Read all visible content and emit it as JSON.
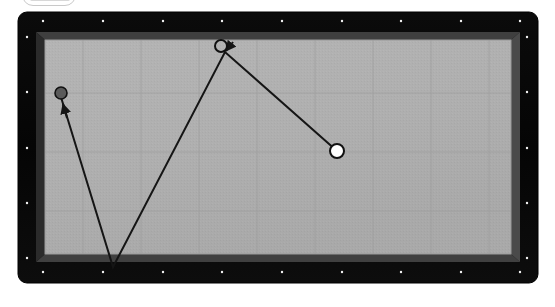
{
  "scene": {
    "title": "Air hockey table top-down view with puck trajectory",
    "background_color": "#ffffff"
  },
  "top_badge": {
    "label": "",
    "note": "partially cut off rounded badge at top-left edge",
    "border_color": "#c9c9c9",
    "fill_color": "#ffffff"
  },
  "table": {
    "name": "game-table",
    "frame_color": "#070707",
    "frame_highlight_color": "#3a3a3a",
    "frame_shadow_color": "#1c1c1c",
    "surface_color": "#b0b0b0",
    "surface_edge_color": "#9a9a9a",
    "grid_color": "#9c9c9c",
    "outer": {
      "x": 1,
      "y": 1,
      "width": 520,
      "height": 271,
      "radius": 9
    },
    "inner": {
      "x": 19,
      "y": 21,
      "width": 484,
      "height": 230
    },
    "rivet_color": "#f2f2f2",
    "rivets_top": [
      26,
      86,
      146,
      205,
      265,
      325,
      384,
      444,
      503
    ],
    "rivets_bottom": [
      26,
      86,
      146,
      205,
      265,
      325,
      384,
      444,
      503
    ],
    "rivets_left": [
      26,
      81,
      137,
      192,
      247
    ],
    "rivets_right": [
      26,
      81,
      137,
      192,
      247
    ],
    "grid_vertical_x": [
      66,
      124,
      182,
      240,
      298,
      356,
      414,
      472
    ],
    "grid_horizontal_y": [
      82,
      141,
      200
    ]
  },
  "markers": [
    {
      "id": "start-puck",
      "label": "start puck",
      "style": "filled-dark",
      "x": 44,
      "y": 82,
      "radius": 6,
      "fill": "#5a5a5a",
      "stroke": "#111111"
    },
    {
      "id": "apex-puck",
      "label": "apex puck",
      "style": "hollow",
      "x": 204,
      "y": 35,
      "radius": 6,
      "fill": "none",
      "stroke": "#111111"
    },
    {
      "id": "end-puck",
      "label": "end puck",
      "style": "filled-white",
      "x": 320,
      "y": 140,
      "radius": 7,
      "fill": "#ffffff",
      "stroke": "#111111"
    }
  ],
  "trajectory": {
    "name": "puck-path",
    "stroke": "#151515",
    "stroke_width": 2,
    "points": [
      {
        "x": 320,
        "y": 140
      },
      {
        "x": 208,
        "y": 41
      },
      {
        "x": 96,
        "y": 256
      },
      {
        "x": 47,
        "y": 96
      }
    ],
    "arrowheads": [
      {
        "at_x": 46,
        "at_y": 92,
        "angle": -72,
        "target": "start-puck"
      },
      {
        "at_x": 208,
        "at_y": 39,
        "angle": -139,
        "target": "apex-puck"
      }
    ]
  }
}
